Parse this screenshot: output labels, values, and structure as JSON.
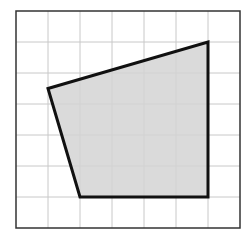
{
  "diagram": {
    "type": "grid-polygon",
    "grid": {
      "columns": 7,
      "rows": 7,
      "origin_px": [
        16,
        11
      ],
      "cell_w_px": 32,
      "cell_h_px": 31,
      "line_color": "#c8c8c8",
      "border_color": "#333333"
    },
    "polygon": {
      "vertices_grid": [
        [
          1,
          2.5
        ],
        [
          6,
          1
        ],
        [
          6,
          6
        ],
        [
          2,
          6
        ]
      ],
      "fill": "#d3d3d3",
      "stroke": "#111111",
      "stroke_width": 3
    }
  }
}
